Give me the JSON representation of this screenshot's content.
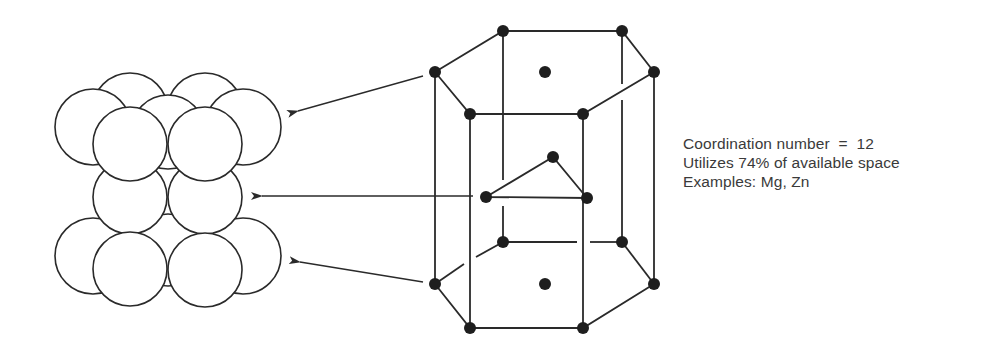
{
  "figure": {
    "type": "hexagonal-close-packed-structure",
    "left_panel": {
      "label": "stacked-spheres",
      "layers": [
        "top",
        "middle",
        "bottom"
      ]
    },
    "right_panel": {
      "label": "hcp-unit-cell",
      "triangle_atoms": 3,
      "top_face_atoms": 7,
      "bottom_face_atoms": 7
    },
    "arrows": [
      {
        "from": "top-face",
        "to": "top-sphere-layer"
      },
      {
        "from": "middle-triangle",
        "to": "middle-sphere-layer"
      },
      {
        "from": "bottom-face",
        "to": "bottom-sphere-layer"
      }
    ],
    "colors": {
      "line": "#2a2a2a",
      "atom": "#1e1e1e",
      "sphere_fill": "#ffffff",
      "text": "#3a3a3a",
      "background": "#ffffff"
    }
  },
  "caption": {
    "line1": "Coordination number  =  12",
    "line2": "Utilizes 74% of available space",
    "line3": "Examples: Mg, Zn"
  }
}
